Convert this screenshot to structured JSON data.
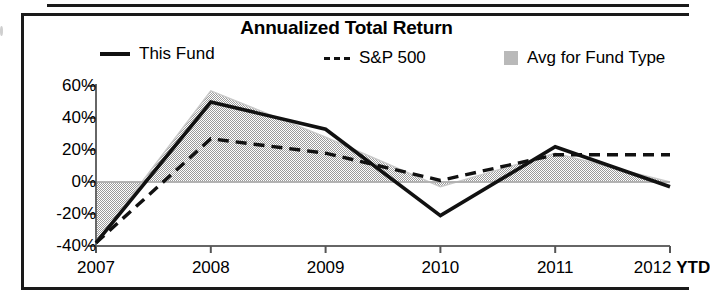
{
  "chart_data": {
    "type": "line",
    "title": "Annualized Total Return",
    "xlabel": "",
    "ylabel": "",
    "categories": [
      "2007",
      "2008",
      "2009",
      "2010",
      "2011",
      "2012 YTD"
    ],
    "x_tick_labels": [
      "2007",
      "2008",
      "2009",
      "2010",
      "2011",
      "2012"
    ],
    "x_last_suffix": "YTD",
    "y_tick_labels": [
      "60%",
      "40%",
      "20%",
      "0%",
      "-20%",
      "-40%"
    ],
    "y_tick_values": [
      60,
      40,
      20,
      0,
      -20,
      -40
    ],
    "ylim": [
      -40,
      60
    ],
    "grid": false,
    "legend_position": "top",
    "zero_line": true,
    "series": [
      {
        "name": "This Fund",
        "style": "solid",
        "color": "#111111",
        "values": [
          -38,
          50,
          33,
          -21,
          22,
          -3
        ]
      },
      {
        "name": "S&P 500",
        "style": "dashed",
        "color": "#111111",
        "values": [
          -38,
          27,
          18,
          1,
          17,
          17
        ]
      },
      {
        "name": "Avg for Fund Type",
        "style": "filled-area",
        "color": "#c2c2c2",
        "values": [
          -38,
          57,
          28,
          -3,
          18,
          0
        ]
      }
    ]
  },
  "legend": {
    "fund": "This Fund",
    "sp500": "S&P 500",
    "avg": "Avg for Fund Type"
  }
}
